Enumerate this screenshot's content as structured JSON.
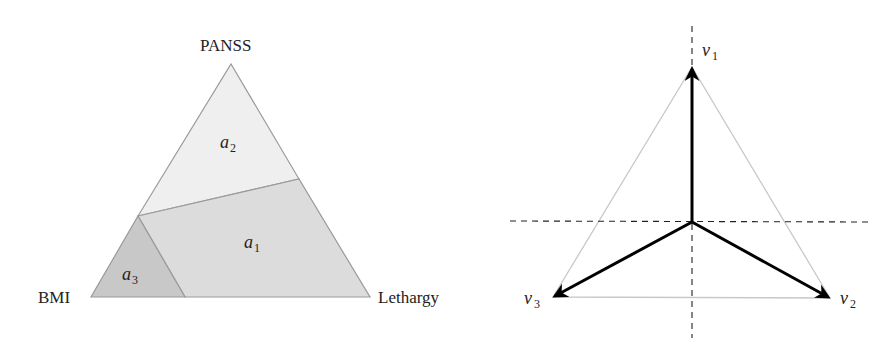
{
  "left_panel": {
    "vertex_labels": {
      "top": "PANSS",
      "bottom_left": "BMI",
      "bottom_right": "Lethargy"
    },
    "regions": [
      {
        "name": "a",
        "subscript": "1",
        "color": "#dcdcdc"
      },
      {
        "name": "a",
        "subscript": "2",
        "color": "#efefef"
      },
      {
        "name": "a",
        "subscript": "3",
        "color": "#c8c8c8"
      }
    ],
    "edge_color": "#9a9a9a"
  },
  "right_panel": {
    "vectors": [
      {
        "name": "v",
        "subscript": "1"
      },
      {
        "name": "v",
        "subscript": "2"
      },
      {
        "name": "v",
        "subscript": "3"
      }
    ],
    "vector_color": "#000000",
    "triangle_color": "#c8c8c8",
    "axis_style": "dashed"
  }
}
